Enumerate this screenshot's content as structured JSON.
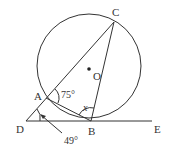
{
  "diagram": {
    "type": "geometry",
    "circle": {
      "center_label": "O"
    },
    "points": {
      "A": "A",
      "B": "B",
      "C": "C",
      "D": "D",
      "E": "E",
      "O": "O"
    },
    "angles": {
      "CAB": "75°",
      "ADB": "49°",
      "ABC": "x"
    },
    "colors": {
      "line": "#333333",
      "background": "#ffffff"
    }
  }
}
